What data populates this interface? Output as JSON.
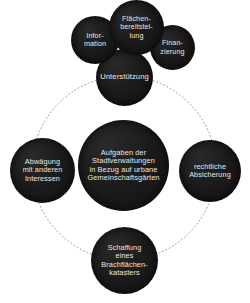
{
  "diagram": {
    "title": "Aufgaben der Stadtverwaltungen in Bezug auf urbane Gemeinschaftsgärten",
    "background_color": "#ffffff",
    "node_fill_color": "#191919",
    "node_text_color": "#e9e7e2",
    "connector_color": "#8c8c8c",
    "connector_style": "dotted-circle",
    "center": {
      "id": "center",
      "label": "Aufgaben der\nStadtverwaltungen\nin Bezug auf urbane\nGemeinschaftsgärten"
    },
    "branches": [
      {
        "id": "support",
        "label": "Unterstützung",
        "position": "top",
        "children": [
          {
            "id": "information",
            "label": "Infor-\nmation"
          },
          {
            "id": "land-provision",
            "label": "Flächen-\nbereitstel-\nlung"
          },
          {
            "id": "funding",
            "label": "Finan-\nzierung"
          }
        ]
      },
      {
        "id": "weighing",
        "label": "Abwägung\nmit anderen\nInteressen",
        "position": "left",
        "children": []
      },
      {
        "id": "legal",
        "label": "rechtliche\nAbsicherung",
        "position": "right",
        "children": []
      },
      {
        "id": "cadastre",
        "label": "Schaffung\neines\nBrachflächen-\nkatasters",
        "position": "bottom",
        "children": []
      }
    ]
  }
}
